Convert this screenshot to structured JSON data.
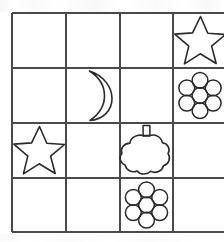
{
  "page": {
    "background_color": "#ffffff",
    "ink_color": "#3a3a3a",
    "shape_stroke_color": "#2b2b2b"
  },
  "grid": {
    "rows": 4,
    "columns": 4,
    "line_color": "#4a4a4a",
    "line_width": 1.6,
    "left": 12,
    "top": 13,
    "right": 227,
    "bottom": 232,
    "column_x": [
      12,
      66,
      120,
      173,
      227
    ],
    "row_y": [
      13,
      68,
      123,
      178,
      232
    ],
    "right_column_cropped": true,
    "cells": [
      {
        "row": 1,
        "column": 1,
        "shape": "empty",
        "label": ""
      },
      {
        "row": 1,
        "column": 2,
        "shape": "empty",
        "label": ""
      },
      {
        "row": 1,
        "column": 3,
        "shape": "empty",
        "label": ""
      },
      {
        "row": 1,
        "column": 4,
        "shape": "star",
        "label": "star"
      },
      {
        "row": 2,
        "column": 1,
        "shape": "empty",
        "label": ""
      },
      {
        "row": 2,
        "column": 2,
        "shape": "moon",
        "label": "crescent moon"
      },
      {
        "row": 2,
        "column": 3,
        "shape": "empty",
        "label": ""
      },
      {
        "row": 2,
        "column": 4,
        "shape": "flower",
        "label": "flower"
      },
      {
        "row": 3,
        "column": 1,
        "shape": "star",
        "label": "star"
      },
      {
        "row": 3,
        "column": 2,
        "shape": "empty",
        "label": ""
      },
      {
        "row": 3,
        "column": 3,
        "shape": "bottle",
        "label": "cloud bottle"
      },
      {
        "row": 3,
        "column": 4,
        "shape": "empty",
        "label": ""
      },
      {
        "row": 4,
        "column": 1,
        "shape": "empty",
        "label": ""
      },
      {
        "row": 4,
        "column": 2,
        "shape": "empty",
        "label": ""
      },
      {
        "row": 4,
        "column": 3,
        "shape": "flower",
        "label": "flower"
      },
      {
        "row": 4,
        "column": 4,
        "shape": "empty",
        "label": ""
      }
    ]
  },
  "shapes": {
    "star": {
      "name": "star-shape",
      "points": 5,
      "fill": "none",
      "stroke": "#2b2b2b",
      "stroke_width": 1.6
    },
    "moon": {
      "name": "moon-shape",
      "orientation": "crescent opening left",
      "fill": "none",
      "stroke": "#2b2b2b",
      "stroke_width": 1.6
    },
    "flower": {
      "name": "flower-shape",
      "petals": 6,
      "has_center": true,
      "fill": "none",
      "stroke": "#2b2b2b",
      "stroke_width": 1.6
    },
    "bottle": {
      "name": "bottle-shape",
      "body": "scalloped cloud",
      "scallops": 8,
      "has_stem": true,
      "fill": "none",
      "stroke": "#2b2b2b",
      "stroke_width": 1.6
    }
  }
}
